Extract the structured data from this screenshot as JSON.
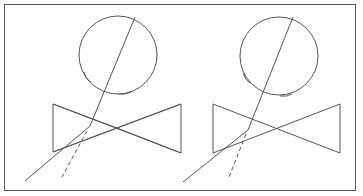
{
  "diagram": {
    "stroke_color": "#555555",
    "panels": [
      {
        "id": "left",
        "circle": {
          "cx": 118,
          "cy": 53,
          "r": 39
        },
        "bowtie": {
          "left_x": 53,
          "right_x": 181,
          "top_y": 104,
          "bottom_y": 153
        },
        "solid_line": [
          [
            134,
            17
          ],
          [
            90,
            126
          ],
          [
            25,
            181
          ]
        ],
        "dashed_line": [
          [
            88,
            130
          ],
          [
            62,
            177
          ]
        ]
      },
      {
        "id": "right",
        "circle": {
          "cx": 279,
          "cy": 53,
          "r": 39
        },
        "bowtie": {
          "left_x": 213,
          "right_x": 340,
          "top_y": 104,
          "bottom_y": 153
        },
        "solid_line": [
          [
            294,
            17
          ],
          [
            248,
            130
          ],
          [
            183,
            182
          ]
        ],
        "dashed_line": [
          [
            246,
            134
          ],
          [
            229,
            177
          ]
        ]
      }
    ]
  }
}
